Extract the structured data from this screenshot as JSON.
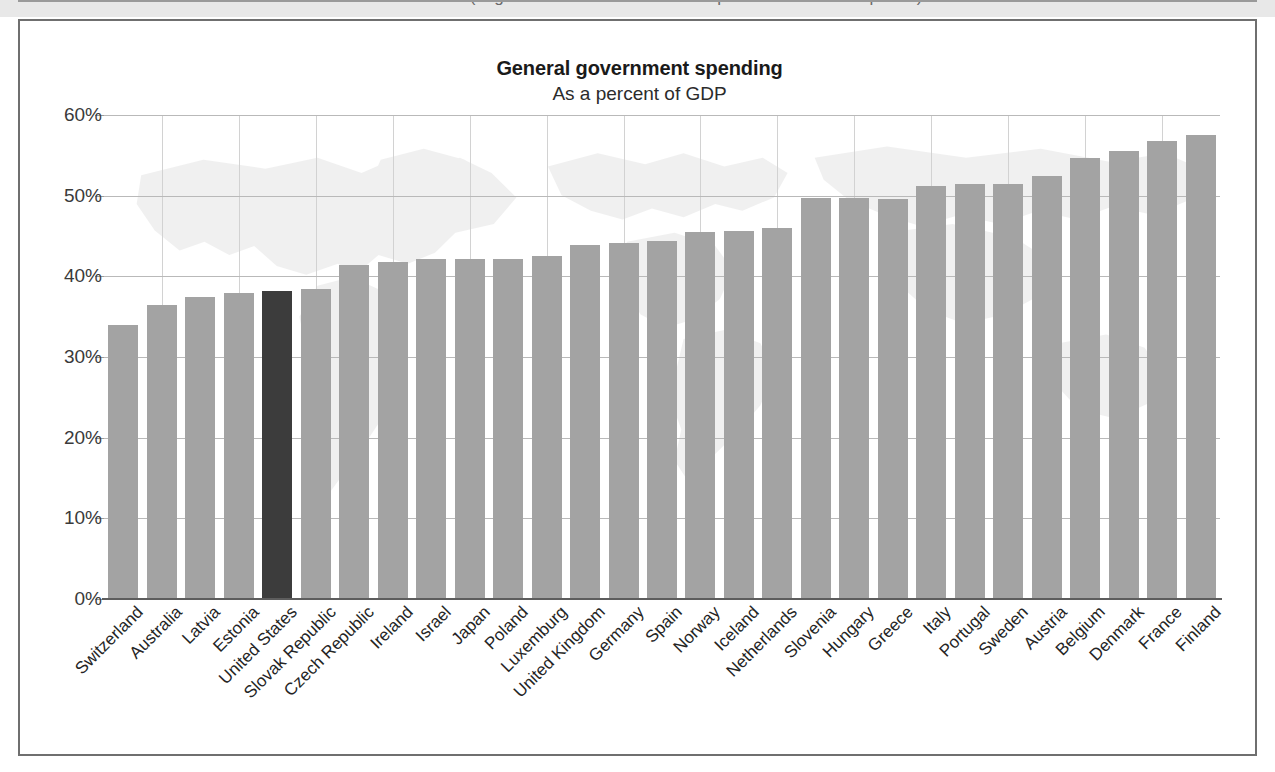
{
  "caption": {
    "text": "Source: OECD (Organisation for Economic Co-operation and Development)"
  },
  "chart_data": {
    "type": "bar",
    "title": "General government spending",
    "subtitle": "As a percent of GDP",
    "xlabel": "",
    "ylabel": "",
    "ylim": [
      0,
      60
    ],
    "ytick_labels": [
      "0%",
      "10%",
      "20%",
      "30%",
      "40%",
      "50%",
      "60%"
    ],
    "ytick_values": [
      0,
      10,
      20,
      30,
      40,
      50,
      60
    ],
    "grid": true,
    "legend": "none",
    "highlight_category": "United States",
    "colors": {
      "bar": "#a3a3a3",
      "bar_highlight": "#3c3c3c",
      "gridline": "#b9b9b9",
      "axis": "#5d5d5d",
      "text": "#242424"
    },
    "categories": [
      "Switzerland",
      "Australia",
      "Latvia",
      "Estonia",
      "United States",
      "Slovak Republic",
      "Czech Republic",
      "Ireland",
      "Israel",
      "Japan",
      "Poland",
      "Luxemburg",
      "United Kingdom",
      "Germany",
      "Spain",
      "Norway",
      "Iceland",
      "Netherlands",
      "Slovenia",
      "Hungary",
      "Greece",
      "Italy",
      "Portugal",
      "Sweden",
      "Austria",
      "Belgium",
      "Denmark",
      "France",
      "Finland"
    ],
    "values": [
      34.0,
      36.4,
      37.5,
      38.0,
      38.2,
      38.4,
      41.4,
      41.8,
      42.1,
      42.1,
      42.1,
      42.5,
      43.9,
      44.2,
      44.4,
      45.5,
      45.6,
      46.0,
      49.7,
      49.7,
      49.6,
      51.2,
      51.5,
      51.5,
      52.4,
      54.7,
      55.5,
      56.8,
      57.5
    ]
  }
}
